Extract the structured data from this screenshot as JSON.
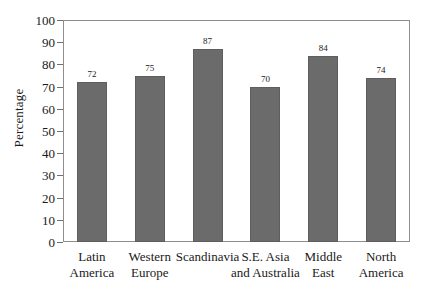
{
  "chart_data": {
    "type": "bar",
    "title": "",
    "xlabel": "",
    "ylabel": "Percentage",
    "ylim": [
      0,
      100
    ],
    "ytick_step": 10,
    "yticks": [
      0,
      10,
      20,
      30,
      40,
      50,
      60,
      70,
      80,
      90,
      100
    ],
    "grid": false,
    "legend": null,
    "bar_color": "#6b6b6b",
    "frame_color": "#8e8e8e",
    "categories": [
      "Latin\nAmerica",
      "Western\nEurope",
      "Scandinavia",
      "S.E. Asia\nand Australia",
      "Middle\nEast",
      "North\nAmerica"
    ],
    "values": [
      72,
      75,
      87,
      70,
      84,
      74
    ],
    "value_labels": [
      "72",
      "75",
      "87",
      "70",
      "84",
      "74"
    ]
  }
}
